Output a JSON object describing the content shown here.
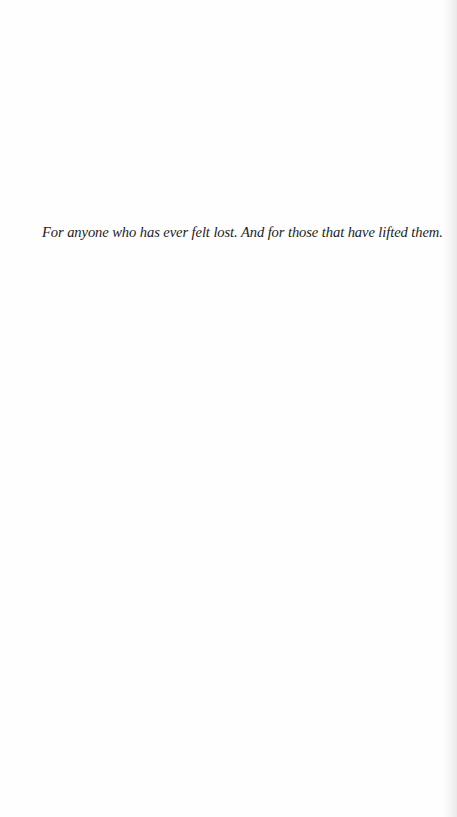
{
  "page": {
    "type": "dedication",
    "background_color": "#fefefe",
    "text_color": "#1c1c1c"
  },
  "dedication": {
    "text": "For anyone who has ever felt lost. And for those that have lifted them."
  }
}
